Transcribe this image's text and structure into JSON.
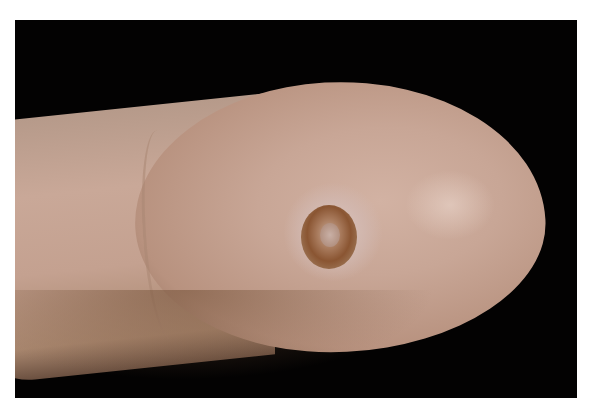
{
  "image": {
    "description": "Clinical photograph of a fingertip with a circular lesion on the pad against a black background",
    "background_color": "#030202",
    "frame_color": "#ffffff",
    "skin_tone": "#c8a696",
    "lesion_color": "#8a5532"
  }
}
